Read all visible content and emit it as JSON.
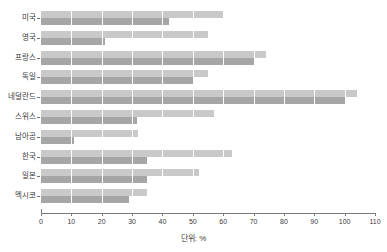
{
  "chart_data": {
    "type": "bar",
    "orientation": "horizontal",
    "title": "",
    "xlabel": "단위: %",
    "ylabel": "",
    "xlim": [
      0,
      110
    ],
    "xticks": [
      0,
      10,
      20,
      30,
      40,
      50,
      60,
      70,
      80,
      90,
      100,
      110
    ],
    "xticklabels": [
      "0",
      "10",
      "20",
      "30",
      "40",
      "50",
      "60",
      "70",
      "80",
      "90",
      "100",
      "110"
    ],
    "grid": true,
    "grid_axis": "x",
    "legend": "none",
    "categories": [
      "미국",
      "영국",
      "프랑스",
      "독일",
      "네덜란드",
      "스위스",
      "남아공",
      "한국",
      "일본",
      "멕시코"
    ],
    "series": [
      {
        "name": "light",
        "color": "#c9c9c9",
        "values": [
          60,
          55,
          74,
          55,
          104,
          57,
          32,
          63,
          52,
          35
        ]
      },
      {
        "name": "dark",
        "color": "#a6a6a6",
        "values": [
          42,
          21,
          70,
          50,
          100,
          31.5,
          11,
          35,
          35,
          29
        ]
      }
    ]
  },
  "axis": {
    "x_title": "단위: %"
  },
  "colors": {
    "bar_light": "#c9c9c9",
    "bar_dark": "#a6a6a6",
    "axis": "#7a7a7a",
    "text": "#3b3b3b",
    "background": "#ffffff",
    "gridline": "#ffffff"
  }
}
